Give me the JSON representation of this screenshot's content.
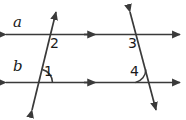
{
  "figure": {
    "type": "geometry-diagram",
    "background_color": "#ffffff",
    "stroke_color": "#3a3a3a",
    "text_color": "#1a1a1a",
    "line_labels": [
      {
        "id": "a",
        "text": "a"
      },
      {
        "id": "b",
        "text": "b"
      }
    ],
    "angle_labels": [
      {
        "id": "1",
        "text": "1"
      },
      {
        "id": "2",
        "text": "2"
      },
      {
        "id": "3",
        "text": "3"
      },
      {
        "id": "4",
        "text": "4"
      }
    ],
    "lines": [
      {
        "name": "line-a",
        "label": "a",
        "kind": "parallel-line",
        "x1": 4,
        "y1": 34,
        "x2": 182,
        "y2": 34,
        "arrowheads": "both",
        "parallel_tick": {
          "x": 90,
          "y": 34,
          "direction": "right"
        }
      },
      {
        "name": "line-b",
        "label": "b",
        "kind": "parallel-line",
        "x1": 4,
        "y1": 82,
        "x2": 182,
        "y2": 82,
        "arrowheads": "both",
        "parallel_tick": {
          "x": 90,
          "y": 82,
          "direction": "right"
        }
      },
      {
        "name": "transversal-left",
        "kind": "transversal",
        "x1": 31,
        "y1": 112,
        "x2": 57,
        "y2": 10,
        "arrowheads": "both"
      },
      {
        "name": "transversal-right",
        "kind": "transversal",
        "x1": 129,
        "y1": 10,
        "x2": 157,
        "y2": 112,
        "arrowheads": "both"
      }
    ],
    "intersections": [
      {
        "name": "left-top",
        "x": 51,
        "y": 34
      },
      {
        "name": "left-bottom",
        "x": 39,
        "y": 82
      },
      {
        "name": "right-top",
        "x": 136,
        "y": 34
      },
      {
        "name": "right-bottom",
        "x": 149,
        "y": 82
      }
    ],
    "angle_arcs": [
      {
        "for": "1",
        "cx": 39,
        "cy": 82,
        "radius": 13,
        "start_deg": 180,
        "end_deg": 104
      },
      {
        "for": "4",
        "cx": 149,
        "cy": 82,
        "radius": 13,
        "start_deg": 180,
        "end_deg": 105
      }
    ]
  }
}
